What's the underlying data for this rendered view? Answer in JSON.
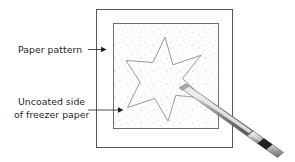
{
  "figure": {
    "type": "line-art-diagram",
    "background_color": "#ffffff",
    "ink_color": "#231f20",
    "line_color": "#58585b",
    "speckle_color": "#a7a9ac"
  },
  "labels": {
    "paper_pattern": {
      "text": "Paper pattern",
      "lines": [
        "Paper pattern"
      ],
      "x": 18,
      "y": 52,
      "leader": {
        "from_x": 88,
        "from_y": 49.5,
        "to_x": 104,
        "to_y": 49.5
      }
    },
    "uncoated_side": {
      "text": "Uncoated side of freezer paper",
      "lines": [
        "Uncoated side",
        "of freezer paper"
      ],
      "x": 18,
      "y": 103,
      "leader": {
        "from_x": 88,
        "from_y": 110,
        "to_x": 122,
        "to_y": 110
      }
    }
  },
  "shapes": {
    "outer_rectangle": {
      "name": "paper-pattern-sheet",
      "x": 96,
      "y": 9,
      "width": 136,
      "height": 138,
      "stroke": "#58585b",
      "fill": "#ffffff"
    },
    "inner_rectangle": {
      "name": "freezer-paper-uncoated-side",
      "x": 113,
      "y": 23,
      "width": 105,
      "height": 105,
      "stroke": "#6d6e71",
      "fill": "#fdfdfd",
      "texture": "speckled"
    },
    "star": {
      "name": "star-pattern-outline",
      "points": 5,
      "center_x": 165,
      "center_y": 77,
      "outer_radius": 40,
      "inner_radius": 17,
      "stroke": "#808285",
      "fill": "none"
    },
    "pen": {
      "name": "marking-pen",
      "tip_x": 180,
      "tip_y": 88,
      "end_x": 283,
      "end_y": 152,
      "barrel_color": "#808285",
      "highlight_color": "#d9dadb",
      "band_color": "#231f20",
      "ferrule_color": "#f1f2f2"
    }
  }
}
